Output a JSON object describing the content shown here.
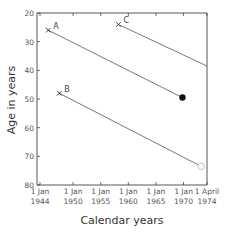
{
  "chart_data": {
    "type": "line",
    "title": "",
    "xlabel": "Calendar years",
    "ylabel": "Age in years",
    "x_ticks": [
      {
        "value": 1944.0,
        "label_top": "1 Jan",
        "label_bottom": "1944"
      },
      {
        "value": 1950.0,
        "label_top": "1 Jan",
        "label_bottom": "1950"
      },
      {
        "value": 1955.0,
        "label_top": "1 Jan",
        "label_bottom": "1955"
      },
      {
        "value": 1960.0,
        "label_top": "1 Jan",
        "label_bottom": "1960"
      },
      {
        "value": 1965.0,
        "label_top": "1 Jan",
        "label_bottom": "1965"
      },
      {
        "value": 1970.0,
        "label_top": "1 Jan",
        "label_bottom": "1970"
      },
      {
        "value": 1974.25,
        "label_top": "1 April",
        "label_bottom": "1974"
      }
    ],
    "y_ticks": [
      20,
      30,
      40,
      50,
      60,
      70,
      80
    ],
    "xlim": [
      1943.5,
      1974.25
    ],
    "ylim": [
      20,
      80
    ],
    "y_inverted": true,
    "grid": false,
    "legend": "none (inline labels A, B, C)",
    "series": [
      {
        "name": "A",
        "start": {
          "x": 1945.5,
          "y": 26,
          "marker": "cross"
        },
        "end": {
          "x": 1969.8,
          "y": 49.5,
          "marker": "filled-circle"
        }
      },
      {
        "name": "B",
        "start": {
          "x": 1947.5,
          "y": 48,
          "marker": "cross"
        },
        "end": {
          "x": 1973.2,
          "y": 73.5,
          "marker": "open-circle"
        }
      },
      {
        "name": "C",
        "start": {
          "x": 1958.2,
          "y": 24,
          "marker": "cross"
        },
        "end": {
          "x": 1974.25,
          "y": 38.5,
          "marker": "none"
        }
      }
    ]
  },
  "axes": {
    "x_title": "Calendar years",
    "y_title": "Age in years"
  }
}
